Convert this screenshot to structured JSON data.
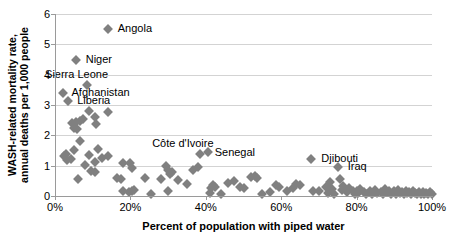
{
  "chart_data": {
    "type": "scatter",
    "title": "",
    "xlabel": "Percent of population with piped water",
    "ylabel": "WASH-related mortality rate, annual deaths per 1,000 people",
    "ylabel_line1": "WASH-related mortality rate,",
    "ylabel_line2": "annual deaths per 1,000 people",
    "xlim": [
      0,
      100
    ],
    "ylim": [
      0,
      6
    ],
    "xticks": [
      "0%",
      "20%",
      "40%",
      "60%",
      "80%",
      "100%"
    ],
    "xtick_values": [
      0,
      20,
      40,
      60,
      80,
      100
    ],
    "yticks": [
      "0",
      "1",
      "2",
      "3",
      "4",
      "5",
      "6"
    ],
    "ytick_values": [
      0,
      1,
      2,
      3,
      4,
      5,
      6
    ],
    "grid": "horizontal",
    "legend": "none",
    "marker": "diamond",
    "marker_color": "#808080",
    "annotations": [
      {
        "label": "Angola",
        "x": 14.0,
        "y": 5.5
      },
      {
        "label": "Niger",
        "x": 5.5,
        "y": 4.48
      },
      {
        "label": "Sierra Leone",
        "x": 8.5,
        "y": 3.65
      },
      {
        "label": "Afghanistan",
        "x": 2.0,
        "y": 3.38
      },
      {
        "label": "Liberia",
        "x": 3.5,
        "y": 3.12
      },
      {
        "label": "Côte d'Ivoire",
        "x": 38.5,
        "y": 1.38
      },
      {
        "label": "Senegal",
        "x": 40.5,
        "y": 1.45
      },
      {
        "label": "Djibouti",
        "x": 68.0,
        "y": 1.22
      },
      {
        "label": "Iraq",
        "x": 75.0,
        "y": 0.95
      }
    ],
    "points": [
      {
        "x": 14.0,
        "y": 5.5
      },
      {
        "x": 5.5,
        "y": 4.48
      },
      {
        "x": 8.5,
        "y": 3.65
      },
      {
        "x": 2.0,
        "y": 3.38
      },
      {
        "x": 3.5,
        "y": 3.12
      },
      {
        "x": 9.0,
        "y": 2.8
      },
      {
        "x": 14.0,
        "y": 2.78
      },
      {
        "x": 4.5,
        "y": 2.42
      },
      {
        "x": 5.5,
        "y": 2.45
      },
      {
        "x": 6.5,
        "y": 2.48
      },
      {
        "x": 7.5,
        "y": 2.55
      },
      {
        "x": 11.0,
        "y": 2.38
      },
      {
        "x": 5.0,
        "y": 2.25
      },
      {
        "x": 5.8,
        "y": 2.2
      },
      {
        "x": 10.5,
        "y": 2.6
      },
      {
        "x": 6.5,
        "y": 1.82
      },
      {
        "x": 11.5,
        "y": 1.55
      },
      {
        "x": 5.0,
        "y": 1.52
      },
      {
        "x": 2.5,
        "y": 1.32
      },
      {
        "x": 3.2,
        "y": 1.2
      },
      {
        "x": 4.2,
        "y": 1.22
      },
      {
        "x": 9.0,
        "y": 1.35
      },
      {
        "x": 12.5,
        "y": 1.25
      },
      {
        "x": 14.0,
        "y": 1.32
      },
      {
        "x": 10.5,
        "y": 1.12
      },
      {
        "x": 2.8,
        "y": 1.4
      },
      {
        "x": 8.0,
        "y": 1.02
      },
      {
        "x": 9.5,
        "y": 0.82
      },
      {
        "x": 10.5,
        "y": 0.8
      },
      {
        "x": 6.0,
        "y": 0.55
      },
      {
        "x": 18.0,
        "y": 1.1
      },
      {
        "x": 20.0,
        "y": 1.08
      },
      {
        "x": 20.5,
        "y": 0.92
      },
      {
        "x": 16.5,
        "y": 0.6
      },
      {
        "x": 17.5,
        "y": 0.55
      },
      {
        "x": 24.0,
        "y": 0.58
      },
      {
        "x": 18.0,
        "y": 0.18
      },
      {
        "x": 19.5,
        "y": 0.12
      },
      {
        "x": 20.5,
        "y": 0.15
      },
      {
        "x": 21.0,
        "y": 0.2
      },
      {
        "x": 25.5,
        "y": 0.05
      },
      {
        "x": 30.0,
        "y": 0.18
      },
      {
        "x": 28.0,
        "y": 0.55
      },
      {
        "x": 29.5,
        "y": 1.0
      },
      {
        "x": 30.0,
        "y": 0.85
      },
      {
        "x": 30.5,
        "y": 0.72
      },
      {
        "x": 31.0,
        "y": 0.78
      },
      {
        "x": 32.5,
        "y": 0.52
      },
      {
        "x": 35.0,
        "y": 0.4
      },
      {
        "x": 36.5,
        "y": 0.85
      },
      {
        "x": 38.0,
        "y": 0.95
      },
      {
        "x": 38.5,
        "y": 1.38
      },
      {
        "x": 40.5,
        "y": 1.45
      },
      {
        "x": 41.0,
        "y": 0.1
      },
      {
        "x": 41.5,
        "y": 0.25
      },
      {
        "x": 42.0,
        "y": 0.35
      },
      {
        "x": 42.5,
        "y": 0.3
      },
      {
        "x": 44.0,
        "y": 0.05
      },
      {
        "x": 46.0,
        "y": 0.42
      },
      {
        "x": 47.5,
        "y": 0.48
      },
      {
        "x": 49.0,
        "y": 0.3
      },
      {
        "x": 50.0,
        "y": 0.25
      },
      {
        "x": 52.0,
        "y": 0.62
      },
      {
        "x": 53.0,
        "y": 0.65
      },
      {
        "x": 53.5,
        "y": 0.58
      },
      {
        "x": 55.0,
        "y": 0.08
      },
      {
        "x": 57.0,
        "y": 0.12
      },
      {
        "x": 58.5,
        "y": 0.35
      },
      {
        "x": 59.5,
        "y": 0.3
      },
      {
        "x": 61.5,
        "y": 0.18
      },
      {
        "x": 63.0,
        "y": 0.28
      },
      {
        "x": 64.0,
        "y": 0.4
      },
      {
        "x": 65.0,
        "y": 0.35
      },
      {
        "x": 68.0,
        "y": 1.22
      },
      {
        "x": 68.5,
        "y": 0.18
      },
      {
        "x": 70.0,
        "y": 0.15
      },
      {
        "x": 72.0,
        "y": 0.3
      },
      {
        "x": 72.5,
        "y": 0.1
      },
      {
        "x": 73.0,
        "y": 0.45
      },
      {
        "x": 73.5,
        "y": 0.22
      },
      {
        "x": 74.0,
        "y": 0.08
      },
      {
        "x": 75.0,
        "y": 0.95
      },
      {
        "x": 75.5,
        "y": 0.55
      },
      {
        "x": 76.0,
        "y": 0.2
      },
      {
        "x": 76.5,
        "y": 0.32
      },
      {
        "x": 77.5,
        "y": 0.12
      },
      {
        "x": 78.0,
        "y": 0.25
      },
      {
        "x": 79.0,
        "y": 0.15
      },
      {
        "x": 79.5,
        "y": 0.08
      },
      {
        "x": 80.0,
        "y": 0.18
      },
      {
        "x": 80.5,
        "y": 0.1
      },
      {
        "x": 81.0,
        "y": 0.22
      },
      {
        "x": 82.0,
        "y": 0.12
      },
      {
        "x": 82.5,
        "y": 0.05
      },
      {
        "x": 83.5,
        "y": 0.15
      },
      {
        "x": 84.0,
        "y": 0.08
      },
      {
        "x": 85.0,
        "y": 0.2
      },
      {
        "x": 85.5,
        "y": 0.1
      },
      {
        "x": 86.5,
        "y": 0.14
      },
      {
        "x": 87.0,
        "y": 0.06
      },
      {
        "x": 87.5,
        "y": 0.22
      },
      {
        "x": 88.0,
        "y": 0.12
      },
      {
        "x": 88.5,
        "y": 0.18
      },
      {
        "x": 89.0,
        "y": 0.08
      },
      {
        "x": 90.0,
        "y": 0.15
      },
      {
        "x": 90.5,
        "y": 0.05
      },
      {
        "x": 91.0,
        "y": 0.2
      },
      {
        "x": 91.5,
        "y": 0.1
      },
      {
        "x": 92.0,
        "y": 0.14
      },
      {
        "x": 92.5,
        "y": 0.06
      },
      {
        "x": 93.0,
        "y": 0.16
      },
      {
        "x": 93.5,
        "y": 0.09
      },
      {
        "x": 94.0,
        "y": 0.12
      },
      {
        "x": 94.5,
        "y": 0.05
      },
      {
        "x": 95.0,
        "y": 0.18
      },
      {
        "x": 95.5,
        "y": 0.1
      },
      {
        "x": 96.0,
        "y": 0.07
      },
      {
        "x": 96.5,
        "y": 0.14
      },
      {
        "x": 97.0,
        "y": 0.08
      },
      {
        "x": 97.5,
        "y": 0.12
      },
      {
        "x": 98.0,
        "y": 0.06
      },
      {
        "x": 98.5,
        "y": 0.1
      },
      {
        "x": 99.0,
        "y": 0.08
      },
      {
        "x": 99.5,
        "y": 0.12
      },
      {
        "x": 100.0,
        "y": 0.06
      }
    ]
  }
}
